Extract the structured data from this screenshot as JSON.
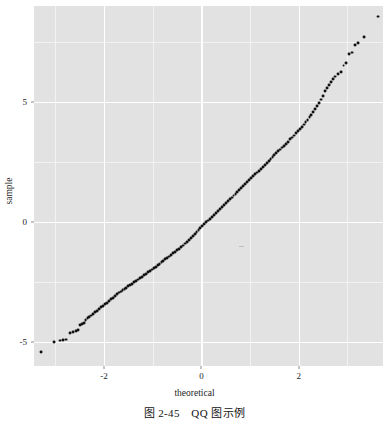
{
  "figure": {
    "caption": "图 2-45　QQ 图示例",
    "caption_number": "2-45",
    "caption_title": "QQ 图示例"
  },
  "axes": {
    "xlabel": "theoretical",
    "ylabel": "sample",
    "x_ticks": [
      {
        "label": "-2",
        "value": -2
      },
      {
        "label": "0",
        "value": 0
      },
      {
        "label": "2",
        "value": 2
      }
    ],
    "y_ticks": [
      {
        "label": "5",
        "value": 5
      },
      {
        "label": "0",
        "value": 0
      },
      {
        "label": "-5",
        "value": -5
      }
    ],
    "x_minor_ticks": [
      -3,
      -1,
      1,
      3
    ],
    "y_minor_ticks": [
      7.5,
      2.5,
      -2.5
    ],
    "panel_background": "#e2e2e2",
    "grid_major_color": "#ffffff",
    "grid_minor_color": "#f2f2f2",
    "point_color": "#111111"
  },
  "chart_data": {
    "type": "scatter",
    "title": "",
    "subtitle": "",
    "xlabel": "theoretical",
    "ylabel": "sample",
    "xlim": [
      -3.44,
      3.73
    ],
    "ylim": [
      -6.0,
      9.0
    ],
    "grid": true,
    "legend": "none",
    "annotations": [],
    "series": [
      {
        "name": "sample quantiles",
        "marker": "filled-circle",
        "color": "#111111",
        "points": [
          [
            -3.3,
            -5.42
          ],
          [
            -3.02,
            -5.0
          ],
          [
            -2.9,
            -4.94
          ],
          [
            -2.84,
            -4.92
          ],
          [
            -2.79,
            -4.9
          ],
          [
            -2.7,
            -4.62
          ],
          [
            -2.63,
            -4.58
          ],
          [
            -2.58,
            -4.54
          ],
          [
            -2.54,
            -4.5
          ],
          [
            -2.5,
            -4.3
          ],
          [
            -2.46,
            -4.26
          ],
          [
            -2.42,
            -4.22
          ],
          [
            -2.38,
            -4.1
          ],
          [
            -2.34,
            -4.02
          ],
          [
            -2.3,
            -3.96
          ],
          [
            -2.26,
            -3.9
          ],
          [
            -2.22,
            -3.84
          ],
          [
            -2.18,
            -3.76
          ],
          [
            -2.14,
            -3.7
          ],
          [
            -2.1,
            -3.62
          ],
          [
            -2.06,
            -3.56
          ],
          [
            -2.02,
            -3.5
          ],
          [
            -1.98,
            -3.42
          ],
          [
            -1.94,
            -3.36
          ],
          [
            -1.9,
            -3.3
          ],
          [
            -1.86,
            -3.22
          ],
          [
            -1.82,
            -3.16
          ],
          [
            -1.78,
            -3.08
          ],
          [
            -1.74,
            -3.0
          ],
          [
            -1.7,
            -2.94
          ],
          [
            -1.66,
            -2.9
          ],
          [
            -1.62,
            -2.84
          ],
          [
            -1.58,
            -2.8
          ],
          [
            -1.54,
            -2.74
          ],
          [
            -1.5,
            -2.68
          ],
          [
            -1.46,
            -2.62
          ],
          [
            -1.42,
            -2.58
          ],
          [
            -1.38,
            -2.52
          ],
          [
            -1.34,
            -2.46
          ],
          [
            -1.3,
            -2.4
          ],
          [
            -1.26,
            -2.34
          ],
          [
            -1.22,
            -2.28
          ],
          [
            -1.18,
            -2.22
          ],
          [
            -1.14,
            -2.16
          ],
          [
            -1.1,
            -2.1
          ],
          [
            -1.06,
            -2.04
          ],
          [
            -1.02,
            -1.98
          ],
          [
            -0.98,
            -1.92
          ],
          [
            -0.94,
            -1.86
          ],
          [
            -0.9,
            -1.8
          ],
          [
            -0.86,
            -1.74
          ],
          [
            -0.82,
            -1.68
          ],
          [
            -0.78,
            -1.62
          ],
          [
            -0.74,
            -1.56
          ],
          [
            -0.7,
            -1.5
          ],
          [
            -0.66,
            -1.44
          ],
          [
            -0.62,
            -1.38
          ],
          [
            -0.58,
            -1.3
          ],
          [
            -0.54,
            -1.24
          ],
          [
            -0.5,
            -1.18
          ],
          [
            -0.46,
            -1.12
          ],
          [
            -0.42,
            -1.04
          ],
          [
            -0.38,
            -0.98
          ],
          [
            -0.34,
            -0.9
          ],
          [
            -0.3,
            -0.82
          ],
          [
            -0.26,
            -0.74
          ],
          [
            -0.22,
            -0.66
          ],
          [
            -0.18,
            -0.58
          ],
          [
            -0.14,
            -0.5
          ],
          [
            -0.1,
            -0.42
          ],
          [
            -0.06,
            -0.34
          ],
          [
            -0.02,
            -0.26
          ],
          [
            0.02,
            -0.18
          ],
          [
            0.06,
            -0.1
          ],
          [
            0.1,
            -0.02
          ],
          [
            0.14,
            0.06
          ],
          [
            0.18,
            0.14
          ],
          [
            0.22,
            0.22
          ],
          [
            0.26,
            0.3
          ],
          [
            0.3,
            0.38
          ],
          [
            0.34,
            0.46
          ],
          [
            0.38,
            0.54
          ],
          [
            0.42,
            0.62
          ],
          [
            0.46,
            0.7
          ],
          [
            0.5,
            0.78
          ],
          [
            0.54,
            0.86
          ],
          [
            0.58,
            0.94
          ],
          [
            0.62,
            1.02
          ],
          [
            0.66,
            1.1
          ],
          [
            0.7,
            1.18
          ],
          [
            0.74,
            1.26
          ],
          [
            0.78,
            1.34
          ],
          [
            0.82,
            1.42
          ],
          [
            0.86,
            1.5
          ],
          [
            0.9,
            1.58
          ],
          [
            0.94,
            1.66
          ],
          [
            0.98,
            1.74
          ],
          [
            1.02,
            1.82
          ],
          [
            1.06,
            1.9
          ],
          [
            1.1,
            1.98
          ],
          [
            1.14,
            2.06
          ],
          [
            1.18,
            2.14
          ],
          [
            1.22,
            2.22
          ],
          [
            1.26,
            2.3
          ],
          [
            1.3,
            2.38
          ],
          [
            1.34,
            2.46
          ],
          [
            1.38,
            2.54
          ],
          [
            1.42,
            2.62
          ],
          [
            1.46,
            2.7
          ],
          [
            1.5,
            2.78
          ],
          [
            1.54,
            2.86
          ],
          [
            1.58,
            2.94
          ],
          [
            1.62,
            3.02
          ],
          [
            1.66,
            3.1
          ],
          [
            1.7,
            3.18
          ],
          [
            1.74,
            3.26
          ],
          [
            1.78,
            3.34
          ],
          [
            1.82,
            3.44
          ],
          [
            1.86,
            3.52
          ],
          [
            1.9,
            3.6
          ],
          [
            1.94,
            3.7
          ],
          [
            1.98,
            3.78
          ],
          [
            2.02,
            3.88
          ],
          [
            2.06,
            3.96
          ],
          [
            2.1,
            4.06
          ],
          [
            2.14,
            4.16
          ],
          [
            2.18,
            4.26
          ],
          [
            2.22,
            4.36
          ],
          [
            2.26,
            4.46
          ],
          [
            2.3,
            4.58
          ],
          [
            2.34,
            4.7
          ],
          [
            2.38,
            4.82
          ],
          [
            2.42,
            4.96
          ],
          [
            2.46,
            5.1
          ],
          [
            2.5,
            5.26
          ],
          [
            2.54,
            5.44
          ],
          [
            2.58,
            5.58
          ],
          [
            2.62,
            5.72
          ],
          [
            2.66,
            5.84
          ],
          [
            2.7,
            5.96
          ],
          [
            2.74,
            6.06
          ],
          [
            2.8,
            6.18
          ],
          [
            2.86,
            6.24
          ],
          [
            2.92,
            6.52
          ],
          [
            2.98,
            6.62
          ],
          [
            3.04,
            6.98
          ],
          [
            3.1,
            7.06
          ],
          [
            3.16,
            7.36
          ],
          [
            3.22,
            7.44
          ],
          [
            3.34,
            7.72
          ],
          [
            3.62,
            8.56
          ]
        ]
      }
    ]
  }
}
